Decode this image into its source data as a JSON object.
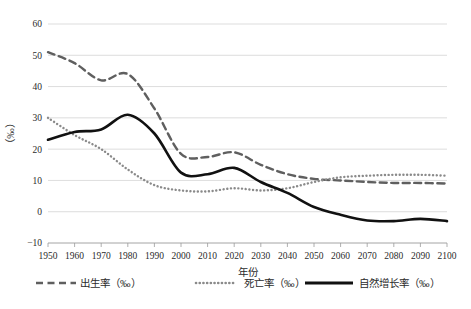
{
  "chart_data": {
    "type": "line",
    "title": "",
    "xlabel": "年份",
    "ylabel": "（‰）",
    "xlim": [
      1950,
      2100
    ],
    "ylim": [
      -10,
      60
    ],
    "ytick_step": 10,
    "xtick_step": 10,
    "grid": true,
    "legend_position": "bottom",
    "xticks": [
      1950,
      1960,
      1970,
      1980,
      1990,
      2000,
      2010,
      2020,
      2030,
      2040,
      2050,
      2060,
      2070,
      2080,
      2090,
      2100
    ],
    "yticks": [
      -10,
      0,
      10,
      20,
      30,
      40,
      50,
      60
    ],
    "x": [
      1950,
      1960,
      1970,
      1980,
      1990,
      2000,
      2010,
      2020,
      2030,
      2040,
      2050,
      2060,
      2070,
      2080,
      2090,
      2100
    ],
    "series": [
      {
        "name": "出生率（‰）",
        "style": "dashed",
        "color": "#5f5f5f",
        "values": [
          51.0,
          47.5,
          42.0,
          44.0,
          33.0,
          18.5,
          17.5,
          19.0,
          15.0,
          12.0,
          10.5,
          10.0,
          9.5,
          9.2,
          9.2,
          9.0
        ]
      },
      {
        "name": "死亡率（‰）",
        "style": "dotted",
        "color": "#8a8a8a",
        "values": [
          30.0,
          24.5,
          20.0,
          13.5,
          8.5,
          6.8,
          6.5,
          7.5,
          6.8,
          7.5,
          9.5,
          11.0,
          11.5,
          11.8,
          11.8,
          11.5
        ]
      },
      {
        "name": "自然增长率（‰）",
        "style": "solid",
        "color": "#111111",
        "values": [
          23.0,
          25.5,
          26.3,
          31.0,
          25.0,
          12.5,
          12.0,
          14.0,
          9.5,
          6.0,
          1.5,
          -1.0,
          -2.8,
          -3.0,
          -2.3,
          -3.0
        ]
      }
    ]
  },
  "legend": {
    "items": [
      {
        "label": "出生率（‰）",
        "style": "dashed",
        "color": "#5f5f5f"
      },
      {
        "label": "死亡率（‰）",
        "style": "dotted",
        "color": "#8a8a8a"
      },
      {
        "label": "自然增长率（‰）",
        "style": "solid",
        "color": "#111111"
      }
    ]
  },
  "axes": {
    "x_title": "年份",
    "y_title": "（‰）"
  }
}
